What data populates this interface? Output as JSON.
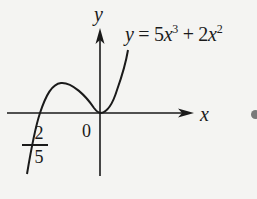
{
  "figure": {
    "type": "function-graph",
    "equation": {
      "lhs": "y",
      "equals": " = ",
      "term1_coef": "5",
      "term1_var": "x",
      "term1_exp": "3",
      "plus": " + ",
      "term2_coef": "2",
      "term2_var": "x",
      "term2_exp": "2"
    },
    "axes": {
      "x_label": "x",
      "y_label": "y",
      "origin_label": "0"
    },
    "root_label": {
      "sign": "−",
      "numerator": "2",
      "denominator": "5"
    },
    "features": {
      "roots": [
        "-2/5",
        "0"
      ],
      "local_max_approx_x": "-4/15",
      "local_min": "(0, 0)"
    },
    "colors": {
      "ink": "#1a1a1a",
      "background": "#f4f4f2",
      "dot": "#7a7a7a"
    }
  }
}
